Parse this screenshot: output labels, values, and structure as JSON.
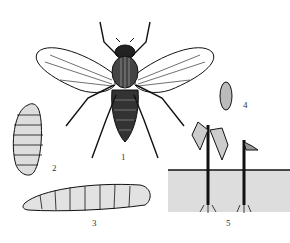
{
  "figure": {
    "labels": {
      "adult": "1",
      "pupa": "2",
      "larva": "3",
      "egg": "4",
      "damage": "5"
    },
    "caption": ""
  }
}
